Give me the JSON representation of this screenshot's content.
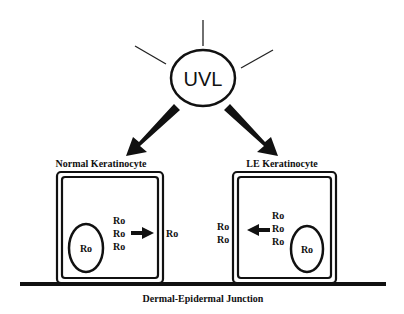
{
  "diagram": {
    "source": {
      "label": "UVL",
      "rays": 3
    },
    "cells": [
      {
        "title": "Normal Keratinocyte",
        "nucleus_label": "Ro",
        "cytoplasm_labels": [
          "Ro",
          "Ro",
          "Ro"
        ],
        "arrow_direction": "right",
        "outside_labels": [
          "Ro"
        ]
      },
      {
        "title": "LE Keratinocyte",
        "nucleus_label": "Ro",
        "cytoplasm_labels": [
          "Ro",
          "Ro",
          "Ro"
        ],
        "arrow_direction": "left",
        "outside_labels": [
          "Ro",
          "Ro"
        ]
      }
    ],
    "baseline_label": "Dermal-Epidermal Junction",
    "colors": {
      "line": "#111111",
      "background": "#ffffff"
    }
  }
}
